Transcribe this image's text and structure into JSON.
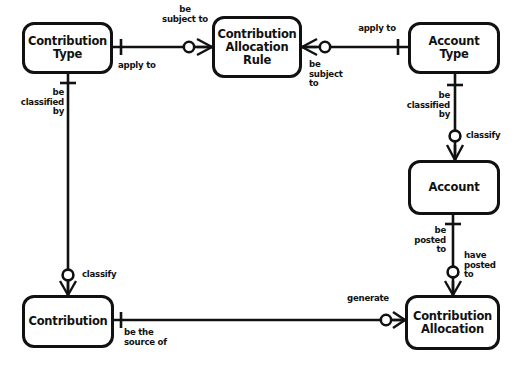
{
  "diagram": {
    "type": "entity-relationship-diagram",
    "notation": "crows-foot",
    "background_color": "#ffffff",
    "line_color": "#111111",
    "entities": [
      {
        "id": "contribution-type",
        "name": "Contribution\nType",
        "x": 22,
        "y": 22,
        "w": 91,
        "h": 52
      },
      {
        "id": "contribution-allocation-rule",
        "name": "Contribution\nAllocation\nRule",
        "x": 212,
        "y": 16,
        "w": 90,
        "h": 62
      },
      {
        "id": "account-type",
        "name": "Account\nType",
        "x": 408,
        "y": 22,
        "w": 92,
        "h": 52
      },
      {
        "id": "account",
        "name": "Account",
        "x": 408,
        "y": 160,
        "w": 92,
        "h": 55
      },
      {
        "id": "contribution",
        "name": "Contribution",
        "x": 22,
        "y": 295,
        "w": 92,
        "h": 53
      },
      {
        "id": "contribution-allocation",
        "name": "Contribution\nAllocation",
        "x": 405,
        "y": 295,
        "w": 95,
        "h": 55
      }
    ],
    "relationships": [
      {
        "id": "rel-ctype-rule",
        "from": "contribution-type",
        "to": "contribution-allocation-rule",
        "from_label": "apply to",
        "to_label": "be\nsubject to"
      },
      {
        "id": "rel-rule-atype",
        "from": "contribution-allocation-rule",
        "to": "account-type",
        "from_label": "be\nsubject\nto",
        "to_label": "apply to"
      },
      {
        "id": "rel-ctype-contribution",
        "from": "contribution-type",
        "to": "contribution",
        "from_label": "be\nclassified\nby",
        "to_label": "classify"
      },
      {
        "id": "rel-atype-account",
        "from": "account-type",
        "to": "account",
        "from_label": "be\nclassified\nby",
        "to_label": "classify"
      },
      {
        "id": "rel-account-callocation",
        "from": "account",
        "to": "contribution-allocation",
        "from_label": "be\nposted\nto",
        "to_label": "have\nposted\nto"
      },
      {
        "id": "rel-contribution-callocation",
        "from": "contribution",
        "to": "contribution-allocation",
        "from_label": "be the\nsource of",
        "to_label": "generate"
      }
    ],
    "labels": [
      {
        "id": "lbl-be-subject-to-top",
        "text": "be\nsubject to",
        "x": 149,
        "y": 5,
        "w": 72,
        "align": "center"
      },
      {
        "id": "lbl-apply-to-left",
        "text": "apply to",
        "x": 118,
        "y": 61,
        "w": 60,
        "align": "left"
      },
      {
        "id": "lbl-be-subject-to-right",
        "text": "be\nsubject\nto",
        "x": 309,
        "y": 60,
        "w": 48,
        "align": "left"
      },
      {
        "id": "lbl-apply-to-right",
        "text": "apply to",
        "x": 348,
        "y": 24,
        "w": 58,
        "align": "center"
      },
      {
        "id": "lbl-be-classified-left",
        "text": "be\nclassified\nby",
        "x": 2,
        "y": 88,
        "w": 62,
        "align": "right"
      },
      {
        "id": "lbl-be-classified-right",
        "text": "be\nclassified\nby",
        "x": 388,
        "y": 91,
        "w": 62,
        "align": "right"
      },
      {
        "id": "lbl-classify-right",
        "text": "classify",
        "x": 466,
        "y": 131,
        "w": 46,
        "align": "left"
      },
      {
        "id": "lbl-be-posted-to",
        "text": "be\nposted\nto",
        "x": 392,
        "y": 226,
        "w": 54,
        "align": "right"
      },
      {
        "id": "lbl-have-posted-to",
        "text": "have\nposted\nto",
        "x": 464,
        "y": 251,
        "w": 48,
        "align": "left"
      },
      {
        "id": "lbl-classify-left",
        "text": "classify",
        "x": 82,
        "y": 270,
        "w": 46,
        "align": "left"
      },
      {
        "id": "lbl-be-the-source-of",
        "text": "be the\nsource of",
        "x": 124,
        "y": 328,
        "w": 62,
        "align": "left"
      },
      {
        "id": "lbl-generate",
        "text": "generate",
        "x": 341,
        "y": 294,
        "w": 54,
        "align": "center"
      }
    ]
  }
}
